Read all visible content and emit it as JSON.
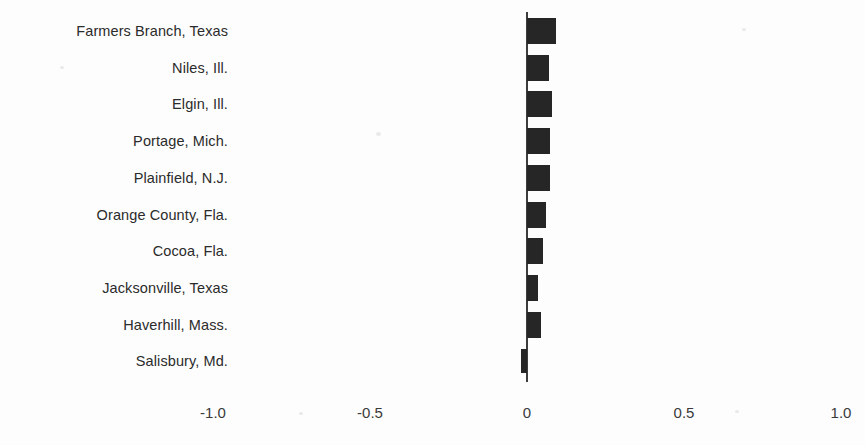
{
  "chart_data": {
    "type": "bar",
    "orientation": "horizontal",
    "title": "",
    "subtitle": "",
    "xlabel": "",
    "ylabel": "",
    "xlim": [
      -1.0,
      1.0
    ],
    "grid": false,
    "legend": null,
    "categories": [
      "Farmers Branch, Texas",
      "Niles, Ill.",
      "Elgin, Ill.",
      "Portage, Mich.",
      "Plainfield, N.J.",
      "Orange County, Fla.",
      "Cocoa, Fla.",
      "Jacksonville, Texas",
      "Haverhill, Mass.",
      "Salisbury, Md."
    ],
    "values": [
      0.092,
      0.07,
      0.08,
      0.073,
      0.073,
      0.06,
      0.05,
      0.035,
      0.045,
      -0.02
    ],
    "xticks": [
      -1.0,
      -0.5,
      0,
      0.5,
      1.0
    ],
    "xticklabels": [
      "-1.0",
      "-0.5",
      "0",
      "0.5",
      "1.0"
    ],
    "bar_color": "#262626",
    "axis_color": "#3d3d3d",
    "background_color": "#fdfdfd"
  }
}
